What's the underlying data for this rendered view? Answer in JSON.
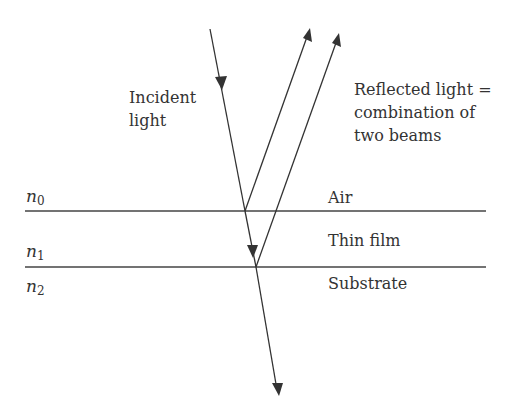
{
  "diagram": {
    "labels": {
      "incident": [
        "Incident",
        "light"
      ],
      "reflected": [
        "Reflected light =",
        "combination of",
        "two beams"
      ],
      "air": "Air",
      "thin_film": "Thin film",
      "substrate": "Substrate"
    },
    "indices": [
      {
        "symbol": "n",
        "sub": "0"
      },
      {
        "symbol": "n",
        "sub": "1"
      },
      {
        "symbol": "n",
        "sub": "2"
      }
    ],
    "colors": {
      "line": "#333333",
      "text": "#333333",
      "background": "#ffffff"
    }
  }
}
